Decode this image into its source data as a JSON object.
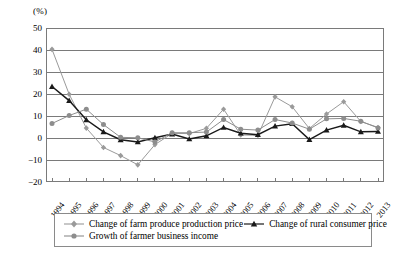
{
  "axis_unit_label": "(%)",
  "legend": {
    "items": [
      {
        "label": "Change of farm produce production price",
        "key": "diamond-marker-light",
        "color": "#9a9a9a"
      },
      {
        "label": "Change of rural consumer price",
        "key": "triangle-marker-black",
        "color": "#1a1a1a"
      },
      {
        "label": "Growth of farmer business income",
        "key": "circle-marker-gray",
        "color": "#8d8d8d"
      }
    ]
  },
  "chart_data": {
    "type": "line",
    "title": "",
    "xlabel": "",
    "ylabel": "(%)",
    "ylim": [
      -20,
      50
    ],
    "ytick_step": 10,
    "yticks": [
      "50",
      "40",
      "30",
      "20",
      "10",
      "0",
      "-10",
      "-20"
    ],
    "grid": true,
    "legend_position": "bottom",
    "categories": [
      "1994",
      "1995",
      "1996",
      "1997",
      "1998",
      "1999",
      "2000",
      "2001",
      "2002",
      "2003",
      "2004",
      "2005",
      "2006",
      "2007",
      "2008",
      "2009",
      "2010",
      "2011",
      "2012",
      "2013"
    ],
    "series": [
      {
        "name": "Change of farm produce production price",
        "color": "#9a9a9a",
        "marker": "diamond",
        "values": [
          40.3,
          19.9,
          4.5,
          -4.3,
          -8.0,
          -12.2,
          -3.0,
          2.1,
          2.0,
          4.4,
          13.1,
          1.4,
          1.2,
          18.7,
          14.2,
          4.3,
          10.9,
          16.5,
          7.5,
          4.8
        ]
      },
      {
        "name": "Change of rural consumer price",
        "color": "#1a1a1a",
        "marker": "triangle",
        "values": [
          23.4,
          17.0,
          8.3,
          2.8,
          -0.8,
          -1.8,
          0.1,
          1.8,
          -0.4,
          1.0,
          4.8,
          2.2,
          1.5,
          5.4,
          6.5,
          -0.7,
          3.6,
          5.8,
          2.8,
          3.0
        ]
      },
      {
        "name": "Growth of farmer business income",
        "color": "#8d8d8d",
        "marker": "circle",
        "values": [
          6.6,
          10.2,
          13.1,
          6.1,
          0.3,
          0.1,
          -1.8,
          2.4,
          2.4,
          2.7,
          8.4,
          4.0,
          3.6,
          8.4,
          6.8,
          4.0,
          8.7,
          8.9,
          7.6,
          4.6
        ]
      }
    ]
  }
}
